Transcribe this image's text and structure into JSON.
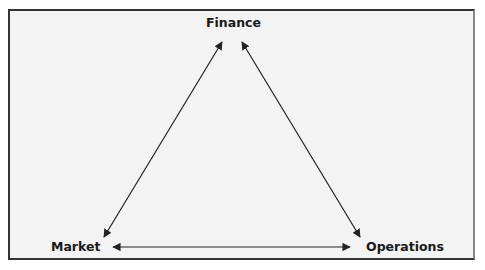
{
  "diagram": {
    "nodes": [
      {
        "id": "finance",
        "label": "Finance"
      },
      {
        "id": "market",
        "label": "Market"
      },
      {
        "id": "operations",
        "label": "Operations"
      }
    ],
    "edges": [
      {
        "from": "market",
        "to": "finance",
        "direction": "both"
      },
      {
        "from": "finance",
        "to": "operations",
        "direction": "both"
      },
      {
        "from": "market",
        "to": "operations",
        "direction": "both"
      }
    ]
  }
}
